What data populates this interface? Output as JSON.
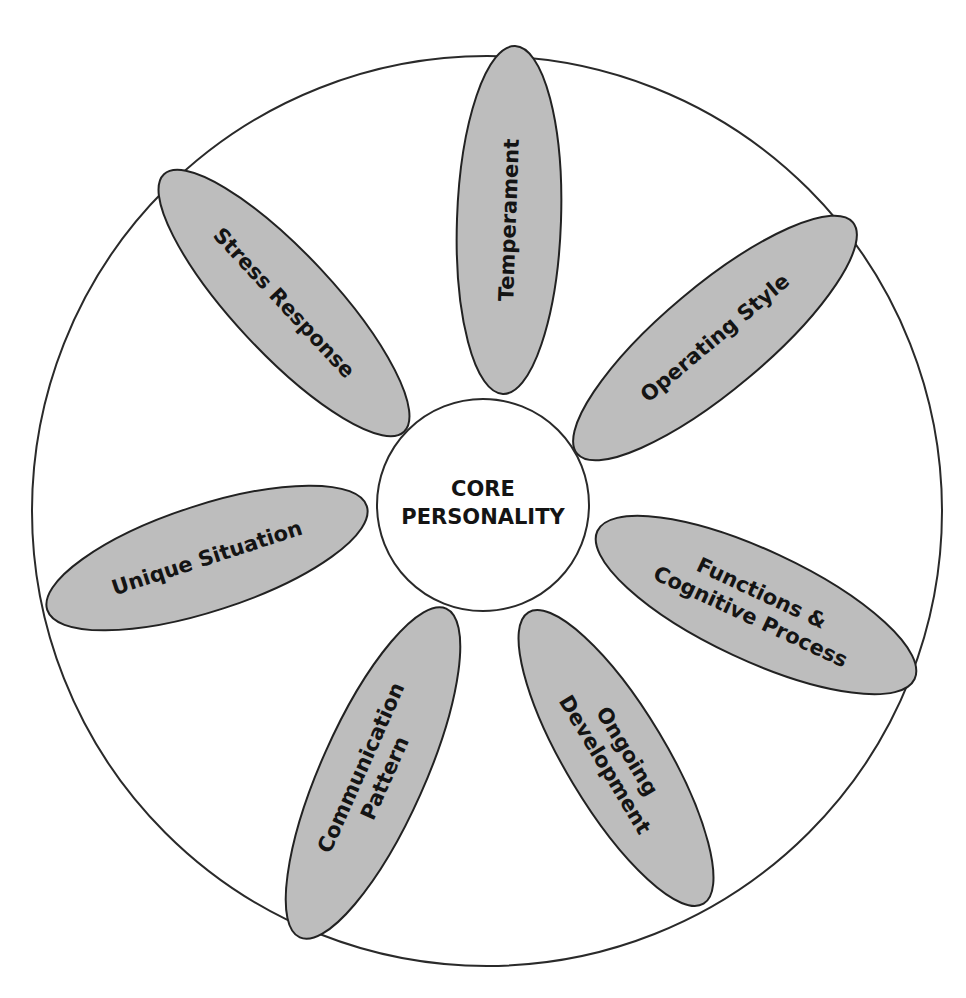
{
  "diagram": {
    "center": {
      "line1": "CORE",
      "line2": "PERSONALITY"
    },
    "petals": [
      {
        "id": "temperament",
        "lines": [
          "Temperament"
        ]
      },
      {
        "id": "operating-style",
        "lines": [
          "Operating Style"
        ]
      },
      {
        "id": "functions",
        "lines": [
          "Functions &",
          "Cognitive Process"
        ]
      },
      {
        "id": "ongoing-development",
        "lines": [
          "Ongoing",
          "Development"
        ]
      },
      {
        "id": "communication-pattern",
        "lines": [
          "Communication",
          "Pattern"
        ]
      },
      {
        "id": "unique-situation",
        "lines": [
          "Unique Situation"
        ]
      },
      {
        "id": "stress-response",
        "lines": [
          "Stress Response"
        ]
      }
    ],
    "colors": {
      "petal_fill": "#bdbdbd",
      "stroke": "#222222",
      "background": "#ffffff"
    }
  }
}
